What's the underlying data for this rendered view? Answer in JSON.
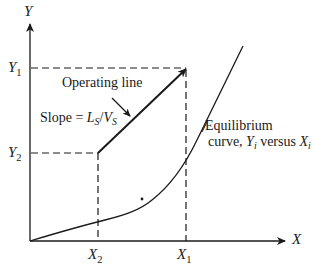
{
  "axes": {
    "y_label": "Y",
    "x_label": "X"
  },
  "ticks": {
    "y1": {
      "base": "Y",
      "sub": "1"
    },
    "y2": {
      "base": "Y",
      "sub": "2"
    },
    "x1": {
      "base": "X",
      "sub": "1"
    },
    "x2": {
      "base": "X",
      "sub": "2"
    }
  },
  "annotations": {
    "operating_line": "Operating line",
    "slope_prefix": "Slope = ",
    "slope_L": "L",
    "slope_L_sub": "S",
    "slope_sep": "/",
    "slope_V": "V",
    "slope_V_sub": "S",
    "equilibrium_line1": "Equilibrium",
    "equilibrium_line2_prefix": "curve, ",
    "equilibrium_Y": "Y",
    "equilibrium_Y_sub": "i",
    "equilibrium_versus": " versus ",
    "equilibrium_X": "X",
    "equilibrium_X_sub": "i"
  },
  "colors": {
    "line": "#1a1a1a",
    "background": "#ffffff"
  }
}
